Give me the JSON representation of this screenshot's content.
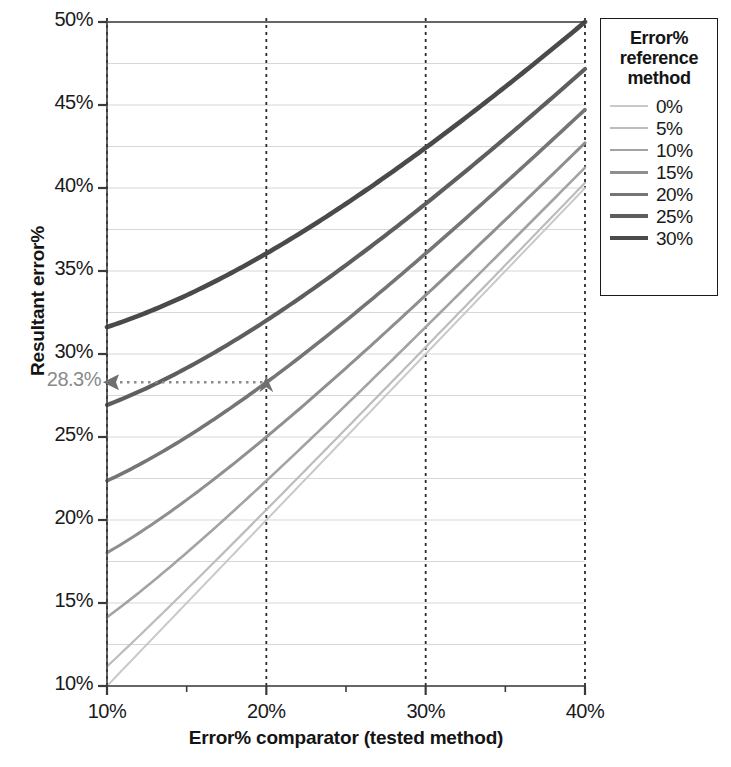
{
  "chart_data": {
    "type": "line",
    "title": "",
    "xlabel": "Error% comparator (tested method)",
    "ylabel": "Resultant error%",
    "xlim": [
      10,
      40
    ],
    "ylim": [
      10,
      50
    ],
    "x_ticks": [
      "10%",
      "20%",
      "30%",
      "40%"
    ],
    "x_tick_values": [
      10,
      20,
      30,
      40
    ],
    "x_minor_tick_values": [
      15,
      25,
      35
    ],
    "y_ticks": [
      "10%",
      "15%",
      "20%",
      "25%",
      "30%",
      "35%",
      "40%",
      "45%",
      "50%"
    ],
    "y_tick_values": [
      10,
      15,
      20,
      25,
      30,
      35,
      40,
      45,
      50
    ],
    "y_minor_gridline_step": 2.5,
    "grid": "horizontal minor gridlines every 2.5%, vertical dashed lines at 10%, 20%, 30%, 40%",
    "legend_position": "right, outside plot area",
    "x": [
      10,
      15,
      20,
      25,
      30,
      35,
      40
    ],
    "series": [
      {
        "name": "0%",
        "reference_error": 0,
        "color": "#c9c9c9",
        "width": 2.0,
        "values": [
          10.0,
          15.0,
          20.0,
          25.0,
          30.0,
          35.0,
          40.0
        ]
      },
      {
        "name": "5%",
        "reference_error": 5,
        "color": "#bcbcbc",
        "width": 2.2,
        "values": [
          11.2,
          15.8,
          20.6,
          25.5,
          30.4,
          35.4,
          40.3
        ]
      },
      {
        "name": "10%",
        "reference_error": 10,
        "color": "#a3a3a3",
        "width": 2.6,
        "values": [
          14.1,
          18.0,
          22.4,
          26.9,
          31.6,
          36.4,
          41.2
        ]
      },
      {
        "name": "15%",
        "reference_error": 15,
        "color": "#8f8f8f",
        "width": 3.0,
        "values": [
          18.0,
          21.2,
          25.0,
          29.2,
          33.5,
          38.1,
          42.7
        ]
      },
      {
        "name": "20%",
        "reference_error": 20,
        "color": "#757575",
        "width": 3.6,
        "values": [
          22.4,
          25.0,
          28.3,
          32.0,
          36.1,
          40.3,
          44.7
        ]
      },
      {
        "name": "25%",
        "reference_error": 25,
        "color": "#5e5e5e",
        "width": 4.1,
        "values": [
          26.9,
          29.2,
          32.0,
          35.4,
          39.1,
          43.0,
          47.2
        ]
      },
      {
        "name": "30%",
        "reference_error": 30,
        "color": "#4a4a4a",
        "width": 4.6,
        "values": [
          31.6,
          33.5,
          36.1,
          39.1,
          42.4,
          46.1,
          50.0
        ]
      }
    ],
    "annotation": {
      "label": "28.3%",
      "label_color": "#8a8a8a",
      "from_x": 20,
      "from_y": 28.3,
      "to_x": 10,
      "to_y": 28.3,
      "style": "dotted arrow pointing left to y-axis, arrowhead at data point on 20% series"
    }
  },
  "legend": {
    "title": "Error%\nreference\nmethod",
    "title_lines": [
      "Error%",
      "reference",
      "method"
    ]
  },
  "axes": {
    "y_title": "Resultant error%",
    "x_title": "Error% comparator (tested method)"
  },
  "colors": {
    "axis": "#3a3a3a",
    "gridline": "#d7d7d7",
    "dashed_guide": "#2b2b2b",
    "annotation": "#8e8e8e",
    "text": "#1a1a1a"
  }
}
